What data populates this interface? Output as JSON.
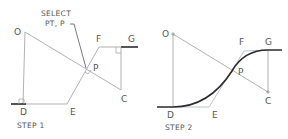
{
  "diagram": {
    "panels": [
      {
        "caption": "STEP 1",
        "callout": [
          "SELECT",
          "PT, P"
        ],
        "points": {
          "O": {
            "label": "O",
            "x": 25,
            "y": 32
          },
          "D": {
            "label": "D",
            "x": 23,
            "y": 104
          },
          "E": {
            "label": "E",
            "x": 67,
            "y": 104
          },
          "P": {
            "label": "P",
            "x": 85,
            "y": 68
          },
          "F": {
            "label": "F",
            "x": 99,
            "y": 47
          },
          "G": {
            "label": "G",
            "x": 135,
            "y": 47
          },
          "C": {
            "label": "C",
            "x": 121,
            "y": 90
          }
        }
      },
      {
        "caption": "STEP 2",
        "points": {
          "O": {
            "label": "O",
            "x": 173,
            "y": 34
          },
          "D": {
            "label": "D",
            "x": 173,
            "y": 107
          },
          "E": {
            "label": "E",
            "x": 209,
            "y": 107
          },
          "P": {
            "label": "P",
            "x": 232,
            "y": 71
          },
          "F": {
            "label": "F",
            "x": 244,
            "y": 51
          },
          "G": {
            "label": "G",
            "x": 268,
            "y": 50
          },
          "C": {
            "label": "C",
            "x": 268,
            "y": 92
          }
        }
      }
    ],
    "colors": {
      "construction_line": "#a8a8a8",
      "tangent_line": "#b6bdc6",
      "curve": "#2b2b2b",
      "label": "#555555"
    }
  }
}
